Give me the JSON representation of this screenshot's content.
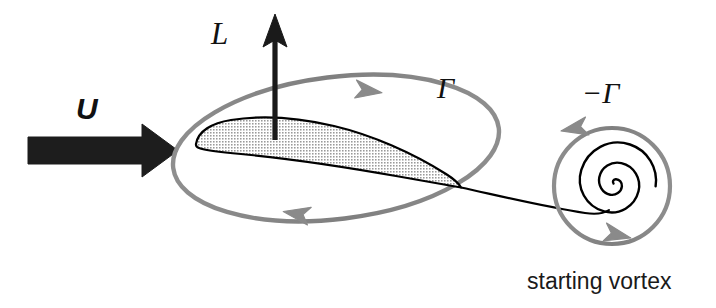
{
  "figure": {
    "background_color": "#ffffff",
    "width": 716,
    "height": 308
  },
  "colors": {
    "ink_black": "#111111",
    "outline_black": "#000000",
    "circulation_gray": "#8c8c8c",
    "airfoil_fill_gray": "#c9c9c9",
    "arrow_black": "#1a1a1a"
  },
  "labels": {
    "freestream_velocity": "U",
    "lift": "L",
    "bound_circulation": "Γ",
    "starting_circulation": "−Γ",
    "starting_vortex_caption": "starting vortex"
  },
  "elements": {
    "freestream_arrow": {
      "name": "freestream-velocity-arrow",
      "direction": "right",
      "style": "thick-filled-block-arrow",
      "color": "#1a1a1a"
    },
    "lift_arrow": {
      "name": "lift-arrow",
      "direction": "up",
      "style": "thin-line-with-triangular-head",
      "color": "#1a1a1a"
    },
    "airfoil": {
      "name": "airfoil-section",
      "fill": "halftone-gray",
      "outline": "#000000",
      "leading_edge": "rounded",
      "trailing_edge": "sharp"
    },
    "bound_vortex_loop": {
      "name": "bound-circulation-loop",
      "shape": "ellipse",
      "color": "#8c8c8c",
      "rotation_sense": "clockwise",
      "arrowheads": 2
    },
    "wake_line": {
      "name": "wake-line",
      "color": "#000000",
      "from": "airfoil-trailing-edge",
      "to": "starting-vortex-core"
    },
    "starting_vortex_spiral": {
      "name": "starting-vortex-spiral",
      "color": "#000000",
      "turns": 2.6,
      "rotation_sense": "counterclockwise"
    },
    "starting_vortex_loop": {
      "name": "starting-vortex-loop",
      "shape": "circle",
      "color": "#8c8c8c",
      "rotation_sense": "counterclockwise",
      "arrowheads": 2
    }
  }
}
